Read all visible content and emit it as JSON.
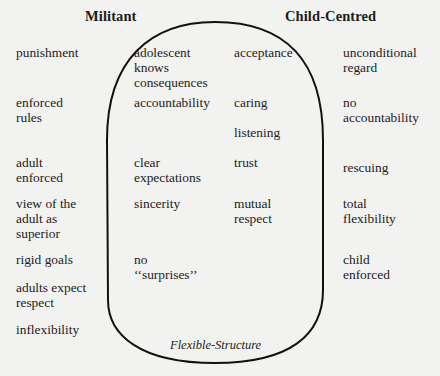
{
  "headers": {
    "militant": "Militant",
    "child_centred": "Child-Centred"
  },
  "columns": {
    "militant": [
      "punishment",
      "enforced\nrules",
      "adult\nenforced",
      "view of the\nadult as\nsuperior",
      "rigid goals",
      "adults expect\nrespect",
      "inflexibility"
    ],
    "flexible_left": [
      "adolescent\nknows\nconsequences",
      "accountability",
      "clear\nexpectations",
      "sincerity",
      "no\n‘‘surprises’’"
    ],
    "flexible_right": [
      "acceptance",
      "caring",
      "listening",
      "trust",
      "mutual\nrespect"
    ],
    "child_centred": [
      "unconditional\nregard",
      "no\naccountability",
      "rescuing",
      "total\nflexibility",
      "child\nenforced"
    ]
  },
  "shape": {
    "caption": "Flexible-Structure",
    "stroke_color": "#111111"
  }
}
